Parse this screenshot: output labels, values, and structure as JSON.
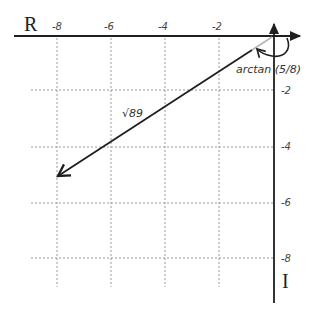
{
  "diagram": {
    "colors": {
      "axis": "#1f1f1f",
      "grid": "#9a9a9a",
      "vector": "#1f1f1f",
      "text": "#333333"
    },
    "axes": {
      "real_label": "R",
      "imag_label": "I",
      "real_ticks": [
        "-8",
        "-6",
        "-4",
        "-2"
      ],
      "imag_ticks": [
        "-2",
        "-4",
        "-6",
        "-8"
      ]
    },
    "vector": {
      "from": [
        0,
        0
      ],
      "to": [
        -8,
        -5
      ],
      "magnitude_label": "√89",
      "angle_label": "arctan (5/8)"
    }
  }
}
